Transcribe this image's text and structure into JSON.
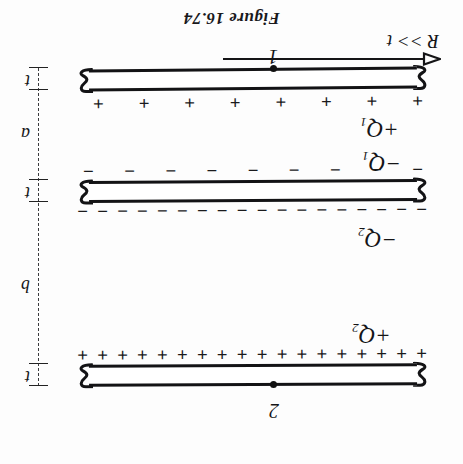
{
  "figure": {
    "caption": "Figure 16.74"
  },
  "plates": [
    {
      "id": "plate-top",
      "name": "top-plate",
      "terminal_label": "2",
      "charge_label": "+Q",
      "charge_subscript": "2",
      "charge_sign": "+",
      "sign_count": 18
    },
    {
      "id": "plate-middle",
      "name": "middle-plate",
      "terminal_label": "",
      "charge_label_upper": "−Q",
      "charge_subscript_upper": "2",
      "charge_label_lower": "−Q",
      "charge_subscript_lower": "1",
      "charge_sign": "−",
      "sign_count_upper": 18,
      "sign_count_lower": 9
    },
    {
      "id": "plate-bottom",
      "name": "bottom-plate",
      "terminal_label": "1",
      "charge_label": "+Q",
      "charge_subscript": "1",
      "charge_sign": "+",
      "sign_count": 8
    }
  ],
  "labels": {
    "q_top": "+Q",
    "q_top_sub": "2",
    "q_mid_upper": "−Q",
    "q_mid_upper_sub": "2",
    "q_mid_lower": "−Q",
    "q_mid_lower_sub": "1",
    "q_bottom": "+Q",
    "q_bottom_sub": "1",
    "terminal_top": "2",
    "terminal_bottom": "1",
    "plus_sign": "+",
    "minus_sign": "−",
    "radius_condition": "R >> t"
  },
  "dimensions": [
    {
      "name": "thickness-top",
      "label": "t",
      "kind": "thickness"
    },
    {
      "name": "gap-upper",
      "label": "b",
      "kind": "gap"
    },
    {
      "name": "thickness-middle",
      "label": "t",
      "kind": "thickness"
    },
    {
      "name": "gap-lower",
      "label": "a",
      "kind": "gap"
    },
    {
      "name": "thickness-bottom",
      "label": "t",
      "kind": "thickness"
    }
  ],
  "colors": {
    "background": "#fdfdfd",
    "ink": "#131315",
    "dimension_line": "#3a3a3d"
  },
  "orientation": {
    "rotation_degrees": 180,
    "note": "scanned page is printed upside-down"
  }
}
